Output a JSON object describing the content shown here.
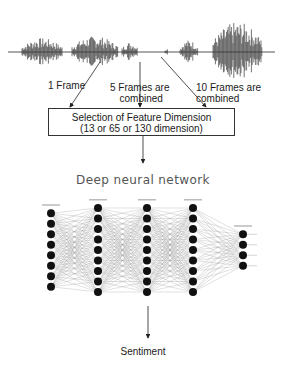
{
  "waveform": {
    "label": "speech-waveform"
  },
  "frame_labels": [
    {
      "text": "1 Frame"
    },
    {
      "line1": "5 Frames are",
      "line2": "combined"
    },
    {
      "line1": "10 Frames are",
      "line2": "combined"
    }
  ],
  "feature_box": {
    "line1": "Selection of Feature Dimension",
    "line2": "(13 or 65 or 130 dimension)"
  },
  "network": {
    "title": "Deep neural network",
    "layers": [
      {
        "nodes": 8,
        "x": 51
      },
      {
        "nodes": 9,
        "x": 98
      },
      {
        "nodes": 9,
        "x": 147
      },
      {
        "nodes": 9,
        "x": 193
      },
      {
        "nodes": 4,
        "x": 243
      }
    ]
  },
  "output": {
    "label": "Sentiment"
  }
}
